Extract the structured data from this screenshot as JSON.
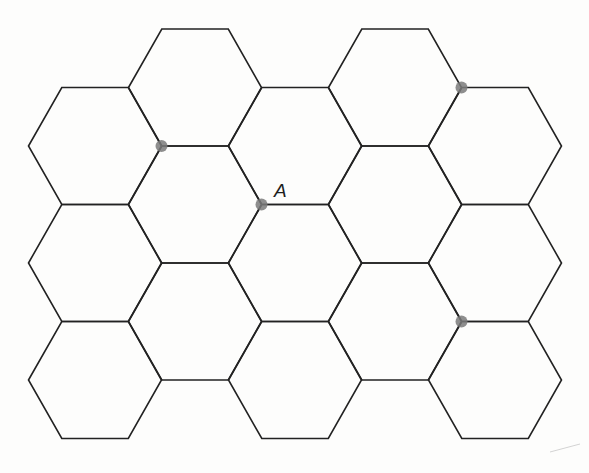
{
  "figure": {
    "type": "hexagonal-lattice",
    "background": "#fdfdfc",
    "line_color": "#222222",
    "dot_color": "#7a7a7a",
    "hex_orientation": "flat-top",
    "hex_side": 66.5,
    "hex_half_height": 58.5,
    "columns": [
      {
        "cx": 95,
        "centers_y": [
          146,
          263,
          380
        ]
      },
      {
        "cx": 195,
        "centers_y": [
          87.5,
          204.5,
          321.5
        ]
      },
      {
        "cx": 295,
        "centers_y": [
          146,
          263,
          380
        ]
      },
      {
        "cx": 395,
        "centers_y": [
          87.5,
          204.5,
          321.5
        ]
      },
      {
        "cx": 495,
        "centers_y": [
          146,
          263,
          380
        ]
      }
    ],
    "marked_points": [
      {
        "name": "marked-vertex-1",
        "x": 161.5,
        "y": 146,
        "label": ""
      },
      {
        "name": "marked-vertex-a",
        "x": 261.5,
        "y": 204.5,
        "label": "A",
        "label_x": 274,
        "label_y": 197
      },
      {
        "name": "marked-vertex-2",
        "x": 461.5,
        "y": 87.5,
        "label": ""
      },
      {
        "name": "marked-vertex-3",
        "x": 461.5,
        "y": 321.5,
        "label": ""
      }
    ],
    "point_label": "A"
  }
}
